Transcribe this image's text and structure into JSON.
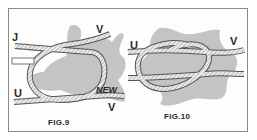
{
  "figures": [
    {
      "id": "fig9",
      "caption": "FIG.9",
      "labels": {
        "top_left": "J",
        "top_right": "V",
        "bottom_left": "U",
        "bottom_right_upper": "NEW",
        "bottom_right_lower": "V"
      }
    },
    {
      "id": "fig10",
      "caption": "FIG.10",
      "labels": {
        "left": "U",
        "right": "V"
      }
    }
  ],
  "colors": {
    "frame": "#8a8a8a",
    "hide": "#bdbdbd",
    "rope_fill": "#e9e9e9",
    "rope_stroke": "#555555",
    "ink": "#2a2a2a"
  }
}
